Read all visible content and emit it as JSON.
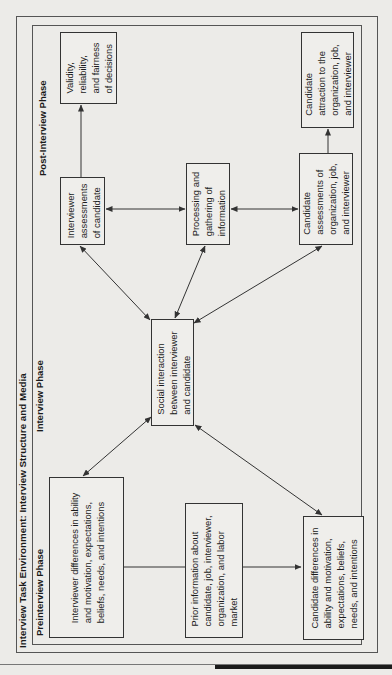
{
  "title": "Interview Task Environment: Interview Structure and Media",
  "phases": {
    "pre": "Preinterview Phase",
    "interview": "Interview Phase",
    "post": "Post-Interview Phase"
  },
  "boxes": {
    "validity": "Validity,\nreliability,\nand fairness\nof decisions",
    "candidate_attraction": "Candidate\nattraction to the\norganization, job,\nand interviewer",
    "interviewer_assessments": "Interviewer\nassessments\nof candidate",
    "processing": "Processing and\ngathering of\ninformation",
    "candidate_assessments": "Candidate\nassessments of\norganization, job,\nand interviewer",
    "social_interaction": "Social interaction\nbetween interviewer\nand candidate",
    "interviewer_differences": "Interviewer differences in ability\nand motivation, expectations,\nbeliefs, needs, and intentions",
    "prior_information": "Prior information about\ncandidate, job, interviewer,\norganization, and labor\nmarket",
    "candidate_differences": "Candidate differences in\nability and motivation,\nexpectations, beliefs,\nneeds, and intentions"
  },
  "colors": {
    "line": "#333333",
    "background": "#ecebe8"
  }
}
